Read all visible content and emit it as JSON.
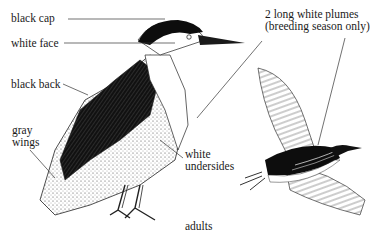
{
  "figure": {
    "caption": "adults"
  },
  "labels": [
    {
      "id": "black-cap",
      "text": "black cap"
    },
    {
      "id": "white-face",
      "text": "white face"
    },
    {
      "id": "black-back",
      "text": "black back"
    },
    {
      "id": "gray-wings",
      "lines": [
        "gray",
        "wings"
      ]
    },
    {
      "id": "white-undersides",
      "lines": [
        "white",
        "undersides"
      ]
    },
    {
      "id": "white-plumes",
      "lines": [
        "2 long white plumes",
        "(breeding season only)"
      ]
    }
  ],
  "colors": {
    "ink": "#1a1a1a",
    "background": "#ffffff",
    "wing_gray": "#d9d9d9"
  }
}
